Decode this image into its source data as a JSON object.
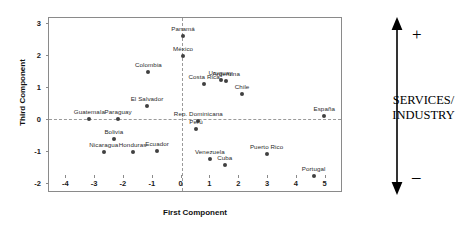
{
  "chart_data": {
    "type": "scatter",
    "title": "",
    "xlabel": "First Component",
    "ylabel": "Third Component",
    "xlim": [
      -4.6,
      5.6
    ],
    "ylim": [
      -2.3,
      3.15
    ],
    "xticks": [
      -4,
      -3,
      -2,
      -1,
      0,
      1,
      2,
      3,
      4,
      5
    ],
    "yticks": [
      -2,
      -1,
      0,
      1,
      2,
      3
    ],
    "grid": false,
    "reference_lines": {
      "x": 0,
      "y": 0,
      "style": "dashed"
    },
    "legend": null,
    "points": [
      {
        "label": "Panamá",
        "x": 0.05,
        "y": 2.58
      },
      {
        "label": "México",
        "x": 0.05,
        "y": 1.98
      },
      {
        "label": "Colombia",
        "x": -1.15,
        "y": 1.47
      },
      {
        "label": "Uruguay",
        "x": 1.35,
        "y": 1.22
      },
      {
        "label": "Argentina",
        "x": 1.55,
        "y": 1.18
      },
      {
        "label": "Costa Rica",
        "x": 0.78,
        "y": 1.1
      },
      {
        "label": "Chile",
        "x": 2.1,
        "y": 0.78
      },
      {
        "label": "El Salvador",
        "x": -1.2,
        "y": 0.42
      },
      {
        "label": "España",
        "x": 4.95,
        "y": 0.1
      },
      {
        "label": "Guatemala",
        "x": -3.2,
        "y": 0.02
      },
      {
        "label": "Paraguay",
        "x": -2.2,
        "y": 0.0
      },
      {
        "label": "Rep. Dominicana",
        "x": 0.58,
        "y": -0.05
      },
      {
        "label": "Perú",
        "x": 0.5,
        "y": -0.3
      },
      {
        "label": "Bolivia",
        "x": -2.35,
        "y": -0.62
      },
      {
        "label": "Venezuela",
        "x": 0.98,
        "y": -1.25
      },
      {
        "label": "Nicaragua",
        "x": -2.7,
        "y": -1.02
      },
      {
        "label": "Honduras",
        "x": -1.7,
        "y": -1.02
      },
      {
        "label": "Ecuador",
        "x": -0.85,
        "y": -1.0
      },
      {
        "label": "Cuba",
        "x": 1.5,
        "y": -1.42
      },
      {
        "label": "Puerto Rico",
        "x": 2.95,
        "y": -1.08
      },
      {
        "label": "Portugal",
        "x": 4.58,
        "y": -1.78
      }
    ]
  },
  "annotation": {
    "plus": "+",
    "minus": "–",
    "lines": [
      "SERVICES/",
      "INDUSTRY"
    ]
  },
  "colors": {
    "point": "#404040",
    "axis": "#8a8a8a",
    "reference_line": "#9a9a9a",
    "text": "#1a1a1a",
    "background": "#ffffff"
  }
}
